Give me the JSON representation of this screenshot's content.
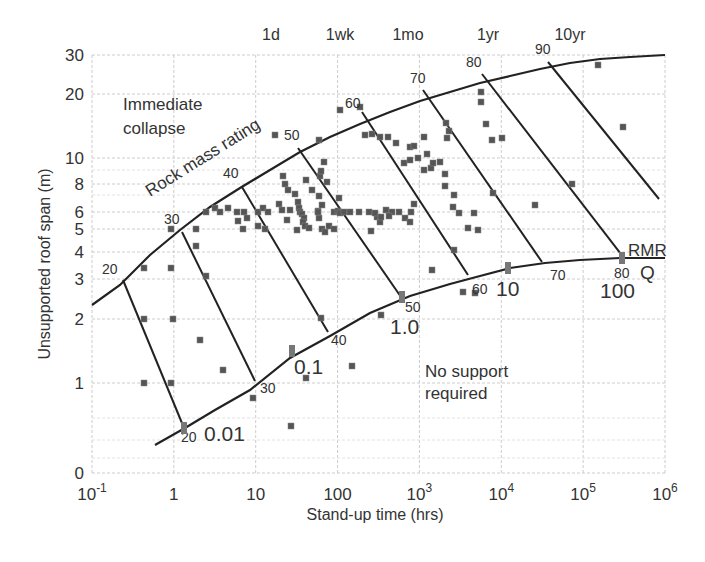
{
  "chart_data": {
    "type": "scatter",
    "title": "",
    "xlabel": "Stand-up time (hrs)",
    "ylabel": "Unsupported roof span (m)",
    "xscale": "log",
    "yscale": "log",
    "xlim": [
      0.1,
      1000000
    ],
    "ylim": [
      0.4,
      30
    ],
    "grid": true,
    "x_ticks": [
      {
        "value": 0.1,
        "base": "10",
        "exp": "-1"
      },
      {
        "value": 1,
        "base": "1",
        "exp": ""
      },
      {
        "value": 10,
        "base": "10",
        "exp": ""
      },
      {
        "value": 100,
        "base": "100",
        "exp": ""
      },
      {
        "value": 1000,
        "base": "10",
        "exp": "3"
      },
      {
        "value": 10000,
        "base": "10",
        "exp": "4"
      },
      {
        "value": 100000,
        "base": "10",
        "exp": "5"
      },
      {
        "value": 1000000,
        "base": "10",
        "exp": "6"
      }
    ],
    "y_ticks": [
      {
        "label": "0",
        "px": 473
      },
      {
        "label": "1",
        "px": 383
      },
      {
        "label": "2",
        "px": 319
      },
      {
        "label": "3",
        "px": 279
      },
      {
        "label": "4",
        "px": 252
      },
      {
        "label": "5",
        "px": 229
      },
      {
        "label": "6",
        "px": 212
      },
      {
        "label": "8",
        "px": 184
      },
      {
        "label": "10",
        "px": 158
      },
      {
        "label": "20",
        "px": 94
      },
      {
        "label": "30",
        "px": 55
      }
    ],
    "top_time_labels": [
      {
        "label": "1d",
        "px": 271
      },
      {
        "label": "1wk",
        "px": 340
      },
      {
        "label": "1mo",
        "px": 408
      },
      {
        "label": "1yr",
        "px": 488
      },
      {
        "label": "10yr",
        "px": 570
      }
    ],
    "region_labels": {
      "upper": [
        "Immediate",
        "collapse"
      ],
      "lower": [
        "No support",
        "required"
      ],
      "rmr_curve": "Rock mass rating",
      "rmr_axis": "RMR",
      "q_axis": "Q"
    },
    "upper_curve": [
      [
        92,
        305
      ],
      [
        120,
        285
      ],
      [
        150,
        255
      ],
      [
        180,
        230
      ],
      [
        210,
        207
      ],
      [
        240,
        188
      ],
      [
        270,
        170
      ],
      [
        300,
        152
      ],
      [
        330,
        137
      ],
      [
        360,
        124
      ],
      [
        390,
        112
      ],
      [
        420,
        101
      ],
      [
        450,
        92
      ],
      [
        480,
        83
      ],
      [
        510,
        76
      ],
      [
        540,
        69
      ],
      [
        570,
        63
      ],
      [
        600,
        59
      ],
      [
        630,
        57
      ],
      [
        665,
        55
      ]
    ],
    "lower_curve": [
      [
        155,
        445
      ],
      [
        185,
        428
      ],
      [
        215,
        410
      ],
      [
        250,
        390
      ],
      [
        290,
        358
      ],
      [
        330,
        336
      ],
      [
        370,
        313
      ],
      [
        410,
        296
      ],
      [
        450,
        284
      ],
      [
        480,
        276
      ],
      [
        510,
        268
      ],
      [
        545,
        263
      ],
      [
        580,
        260
      ],
      [
        620,
        258
      ],
      [
        665,
        258
      ]
    ],
    "rmr_lines": [
      {
        "rmr": "20",
        "top": [
          123,
          280
        ],
        "bottom": [
          184,
          428
        ]
      },
      {
        "rmr": "30",
        "top": [
          182,
          232
        ],
        "bottom": [
          255,
          381
        ]
      },
      {
        "rmr": "40",
        "top": [
          242,
          187
        ],
        "bottom": [
          328,
          332
        ]
      },
      {
        "rmr": "50",
        "top": [
          298,
          148
        ],
        "bottom": [
          401,
          297
        ]
      },
      {
        "rmr": "60",
        "top": [
          362,
          112
        ],
        "bottom": [
          468,
          275
        ]
      },
      {
        "rmr": "70",
        "top": [
          423,
          90
        ],
        "bottom": [
          542,
          262
        ]
      },
      {
        "rmr": "80",
        "top": [
          482,
          74
        ],
        "bottom": [
          624,
          258
        ]
      },
      {
        "rmr": "90",
        "top": [
          548,
          62
        ],
        "bottom": [
          659,
          199
        ]
      }
    ],
    "rmr_top_labels": [
      {
        "label": "20",
        "x": 102,
        "y": 274
      },
      {
        "label": "30",
        "x": 164,
        "y": 224
      },
      {
        "label": "40",
        "x": 223,
        "y": 178
      },
      {
        "label": "50",
        "x": 284,
        "y": 140
      },
      {
        "label": "60",
        "x": 345,
        "y": 108
      },
      {
        "label": "70",
        "x": 410,
        "y": 83
      },
      {
        "label": "80",
        "x": 466,
        "y": 67
      },
      {
        "label": "90",
        "x": 535,
        "y": 54
      }
    ],
    "rmr_bottom_labels": [
      {
        "label": "20",
        "x": 181,
        "y": 442
      },
      {
        "label": "30",
        "x": 260,
        "y": 393
      },
      {
        "label": "40",
        "x": 331,
        "y": 345
      },
      {
        "label": "50",
        "x": 405,
        "y": 312
      },
      {
        "label": "60",
        "x": 472,
        "y": 294
      },
      {
        "label": "70",
        "x": 550,
        "y": 280
      },
      {
        "label": "80",
        "x": 614,
        "y": 278
      }
    ],
    "q_labels": [
      {
        "label": "0.01",
        "x": 204,
        "y": 441,
        "tick": [
          184,
          428
        ]
      },
      {
        "label": "0.1",
        "x": 294,
        "y": 374,
        "tick": [
          292,
          351
        ]
      },
      {
        "label": "1.0",
        "x": 390,
        "y": 334,
        "tick": [
          402,
          297
        ]
      },
      {
        "label": "10",
        "x": 496,
        "y": 296,
        "tick": [
          508,
          268
        ]
      },
      {
        "label": "100",
        "x": 600,
        "y": 298,
        "tick": [
          622,
          258
        ]
      }
    ],
    "points_px": [
      [
        144,
        268
      ],
      [
        144,
        319
      ],
      [
        144,
        383
      ],
      [
        171,
        229
      ],
      [
        171,
        383
      ],
      [
        171,
        268
      ],
      [
        173,
        319
      ],
      [
        196,
        229
      ],
      [
        196,
        246
      ],
      [
        206,
        276
      ],
      [
        206,
        212
      ],
      [
        215,
        208
      ],
      [
        220,
        212
      ],
      [
        228,
        208
      ],
      [
        237,
        212
      ],
      [
        238,
        221
      ],
      [
        243,
        229
      ],
      [
        244,
        212
      ],
      [
        247,
        218
      ],
      [
        258,
        212
      ],
      [
        263,
        208
      ],
      [
        268,
        212
      ],
      [
        258,
        226
      ],
      [
        265,
        229
      ],
      [
        275,
        135
      ],
      [
        279,
        204
      ],
      [
        285,
        184
      ],
      [
        288,
        190
      ],
      [
        283,
        176
      ],
      [
        295,
        194
      ],
      [
        298,
        202
      ],
      [
        299,
        208
      ],
      [
        300,
        212
      ],
      [
        302,
        214
      ],
      [
        304,
        218
      ],
      [
        303,
        222
      ],
      [
        305,
        226
      ],
      [
        297,
        230
      ],
      [
        287,
        220
      ],
      [
        282,
        210
      ],
      [
        290,
        210
      ],
      [
        306,
        180
      ],
      [
        312,
        190
      ],
      [
        318,
        211
      ],
      [
        319,
        218
      ],
      [
        309,
        228
      ],
      [
        322,
        229
      ],
      [
        318,
        212
      ],
      [
        319,
        196
      ],
      [
        320,
        176
      ],
      [
        322,
        205
      ],
      [
        325,
        232
      ],
      [
        329,
        226
      ],
      [
        321,
        171
      ],
      [
        324,
        162
      ],
      [
        327,
        182
      ],
      [
        334,
        212
      ],
      [
        338,
        211
      ],
      [
        334,
        229
      ],
      [
        319,
        140
      ],
      [
        339,
        198
      ],
      [
        340,
        213
      ],
      [
        344,
        212
      ],
      [
        350,
        212
      ],
      [
        359,
        212
      ],
      [
        369,
        212
      ],
      [
        377,
        217
      ],
      [
        375,
        213
      ],
      [
        386,
        210
      ],
      [
        392,
        212
      ],
      [
        399,
        212
      ],
      [
        405,
        218
      ],
      [
        411,
        212
      ],
      [
        414,
        204
      ],
      [
        389,
        216
      ],
      [
        410,
        222
      ],
      [
        371,
        231
      ],
      [
        372,
        134
      ],
      [
        380,
        222
      ],
      [
        381,
        217
      ],
      [
        360,
        107
      ],
      [
        340,
        110
      ],
      [
        365,
        135
      ],
      [
        380,
        137
      ],
      [
        388,
        137
      ],
      [
        396,
        143
      ],
      [
        404,
        163
      ],
      [
        410,
        147
      ],
      [
        410,
        160
      ],
      [
        414,
        146
      ],
      [
        418,
        158
      ],
      [
        424,
        170
      ],
      [
        424,
        137
      ],
      [
        427,
        154
      ],
      [
        431,
        168
      ],
      [
        433,
        163
      ],
      [
        440,
        162
      ],
      [
        445,
        174
      ],
      [
        447,
        138
      ],
      [
        449,
        131
      ],
      [
        446,
        123
      ],
      [
        445,
        186
      ],
      [
        453,
        207
      ],
      [
        459,
        213
      ],
      [
        468,
        228
      ],
      [
        474,
        213
      ],
      [
        481,
        92
      ],
      [
        481,
        102
      ],
      [
        486,
        124
      ],
      [
        502,
        138
      ],
      [
        492,
        140
      ],
      [
        493,
        193
      ],
      [
        454,
        195
      ],
      [
        478,
        230
      ],
      [
        454,
        250
      ],
      [
        535,
        205
      ],
      [
        572,
        184
      ],
      [
        598,
        65
      ],
      [
        623,
        127
      ],
      [
        291,
        426
      ],
      [
        321,
        318
      ],
      [
        381,
        315
      ],
      [
        352,
        366
      ],
      [
        306,
        378
      ],
      [
        253,
        398
      ],
      [
        223,
        370
      ],
      [
        200,
        340
      ],
      [
        432,
        270
      ],
      [
        463,
        292
      ],
      [
        475,
        293
      ]
    ],
    "colors": {
      "line": "#222222",
      "grid": "#cccccc",
      "point": "#555555",
      "tick_mark": "#777777",
      "text": "#333333"
    }
  }
}
